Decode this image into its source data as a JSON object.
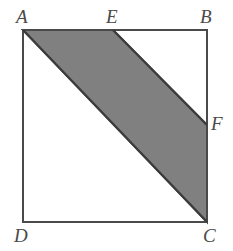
{
  "figure": {
    "kind": "geometry-diagram",
    "canvas": {
      "width": 233,
      "height": 251
    },
    "colors": {
      "background": "#ffffff",
      "stroke": "#4a4a4a",
      "shade_fill": "#808080",
      "shade_stroke": "#3c3c3c",
      "label_color": "#4a4a4a"
    },
    "stroke_width": 2,
    "square": {
      "name": "ABCD",
      "points": [
        {
          "id": "A",
          "x": 23,
          "y": 30
        },
        {
          "id": "B",
          "x": 207,
          "y": 30
        },
        {
          "id": "C",
          "x": 207,
          "y": 222
        },
        {
          "id": "D",
          "x": 23,
          "y": 222
        }
      ],
      "path": "M 23 30 L 207 30 L 207 222 L 23 222 Z"
    },
    "shaded_region": {
      "name": "AEFC",
      "fill": "#808080",
      "points": [
        {
          "id": "A",
          "x": 23,
          "y": 30
        },
        {
          "id": "E",
          "x": 113,
          "y": 30
        },
        {
          "id": "F",
          "x": 207,
          "y": 125
        },
        {
          "id": "C",
          "x": 207,
          "y": 222
        }
      ],
      "path": "M 23 30 L 113 30 L 207 125 L 207 222 Z"
    },
    "interior_segments": [
      {
        "id": "AC",
        "from": "A",
        "to": "C",
        "x1": 23,
        "y1": 30,
        "x2": 207,
        "y2": 222
      },
      {
        "id": "EF",
        "from": "E",
        "to": "F",
        "x1": 113,
        "y1": 30,
        "x2": 207,
        "y2": 125
      }
    ],
    "labels": [
      {
        "id": "label-A",
        "text": "A",
        "left": 16,
        "top": 7
      },
      {
        "id": "label-E",
        "text": "E",
        "left": 106,
        "top": 7
      },
      {
        "id": "label-B",
        "text": "B",
        "left": 200,
        "top": 7
      },
      {
        "id": "label-F",
        "text": "F",
        "left": 211,
        "top": 114
      },
      {
        "id": "label-D",
        "text": "D",
        "left": 14,
        "top": 226
      },
      {
        "id": "label-C",
        "text": "C",
        "left": 203,
        "top": 226
      }
    ]
  }
}
